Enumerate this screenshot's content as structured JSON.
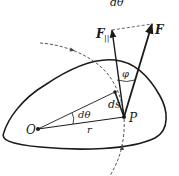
{
  "diagram": {
    "top_label": "dθ",
    "labels": {
      "force_parallel": "F",
      "force_parallel_sub": "||",
      "force": "F",
      "angle_phi": "φ",
      "arc_length": "ds",
      "point_p": "P",
      "origin": "O",
      "angle_dtheta": "dθ",
      "radius": "r"
    },
    "colors": {
      "stroke": "#1a1a1a",
      "dashed": "#555555",
      "background": "#ffffff"
    }
  }
}
